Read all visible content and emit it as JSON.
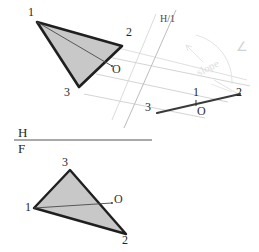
{
  "drawing": {
    "title": "Descriptive geometry: true-size plane and edge view",
    "background_color": "#ffffff",
    "ink_color": "#1f1f1f",
    "fill_color": "#c8c8c8",
    "construction_color": "#c9c9c9",
    "faint_color": "#dcdcdc"
  },
  "reference_line": {
    "upper_label": "H",
    "lower_label": "F"
  },
  "fold_line": {
    "label": "H/1"
  },
  "annotation": {
    "slope_text": "slope",
    "angle_symbol": "∠"
  },
  "top_view": {
    "name": "top-view-triangle",
    "vertices": [
      {
        "label": "1",
        "x": 37,
        "y": 22,
        "label_x": 28,
        "label_y": 11
      },
      {
        "label": "2",
        "x": 122,
        "y": 46,
        "label_x": 125,
        "label_y": 31
      },
      {
        "label": "3",
        "x": 79,
        "y": 87,
        "label_x": 65,
        "label_y": 87
      }
    ],
    "point_o": {
      "label": "O",
      "x": 112,
      "y": 66,
      "label_x": 111,
      "label_y": 66
    }
  },
  "edge_view": {
    "name": "edge-view-line",
    "points": [
      {
        "label": "3",
        "x": 157,
        "y": 110,
        "label_x": 146,
        "label_y": 104
      },
      {
        "label": "1",
        "x": 196,
        "y": 103,
        "label_x": 192,
        "label_y": 89
      },
      {
        "label": "O",
        "x": 200,
        "y": 102,
        "label_x": 198,
        "label_y": 106
      },
      {
        "label": "2",
        "x": 237,
        "y": 95,
        "label_x": 236,
        "label_y": 89
      }
    ]
  },
  "front_view": {
    "name": "front-view-triangle",
    "vertices": [
      {
        "label": "3",
        "x": 70,
        "y": 170,
        "label_x": 62,
        "label_y": 160
      },
      {
        "label": "1",
        "x": 34,
        "y": 208,
        "label_x": 26,
        "label_y": 206
      },
      {
        "label": "2",
        "x": 126,
        "y": 234,
        "label_x": 123,
        "label_y": 236
      }
    ],
    "point_o": {
      "label": "O",
      "x": 112,
      "y": 203,
      "label_x": 114,
      "label_y": 197
    }
  }
}
